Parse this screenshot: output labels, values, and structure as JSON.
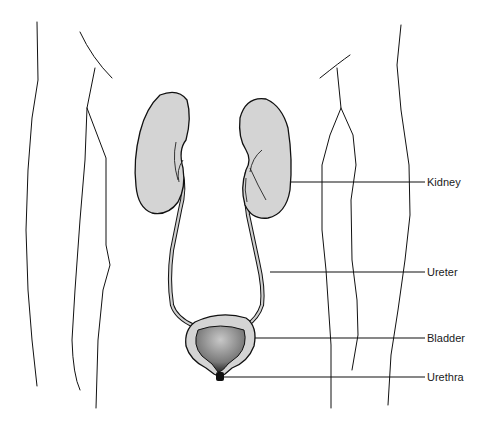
{
  "diagram": {
    "type": "anatomical illustration",
    "colors": {
      "line": "#111111",
      "organ_fill": "#d4d4d4",
      "bladder_inner": "#9a9a9a",
      "background": "#ffffff"
    },
    "labels": [
      {
        "id": "kidney",
        "text": "Kidney"
      },
      {
        "id": "ureter",
        "text": "Ureter"
      },
      {
        "id": "bladder",
        "text": "Bladder"
      },
      {
        "id": "urethra",
        "text": "Urethra"
      }
    ]
  }
}
